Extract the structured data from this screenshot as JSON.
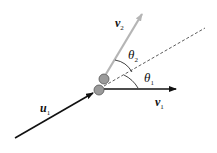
{
  "diagram": {
    "type": "elastic-collision-vector-diagram",
    "labels": {
      "u1": {
        "base": "u",
        "sub": "1"
      },
      "v1": {
        "base": "v",
        "sub": "1"
      },
      "v2": {
        "base": "v",
        "sub": "2"
      },
      "theta1": {
        "base": "θ",
        "sub": "1"
      },
      "theta2": {
        "base": "θ",
        "sub": "2"
      }
    },
    "colors": {
      "incoming_arrow": "#111111",
      "v1_arrow": "#111111",
      "v2_arrow": "#b5b5b5",
      "ball_fill": "#9a9a9a",
      "ball_stroke": "#555555",
      "dashed_line": "#333333"
    },
    "caption": ""
  }
}
